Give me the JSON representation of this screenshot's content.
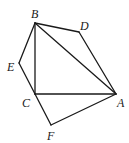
{
  "diagram": {
    "type": "geometry",
    "points": {
      "A": {
        "x": 116,
        "y": 94,
        "label": "A",
        "lx": 117,
        "ly": 107
      },
      "B": {
        "x": 35,
        "y": 23,
        "label": "B",
        "lx": 31,
        "ly": 18
      },
      "C": {
        "x": 35,
        "y": 94,
        "label": "C",
        "lx": 22,
        "ly": 107
      },
      "D": {
        "x": 79,
        "y": 32,
        "label": "D",
        "lx": 80,
        "ly": 30
      },
      "E": {
        "x": 19,
        "y": 63,
        "label": "E",
        "lx": 7,
        "ly": 71
      },
      "F": {
        "x": 51,
        "y": 125,
        "label": "F",
        "lx": 47,
        "ly": 140
      }
    },
    "segments": [
      [
        "B",
        "D"
      ],
      [
        "D",
        "A"
      ],
      [
        "B",
        "A"
      ],
      [
        "B",
        "C"
      ],
      [
        "C",
        "A"
      ],
      [
        "B",
        "E"
      ],
      [
        "E",
        "C"
      ],
      [
        "C",
        "F"
      ],
      [
        "F",
        "A"
      ]
    ]
  }
}
